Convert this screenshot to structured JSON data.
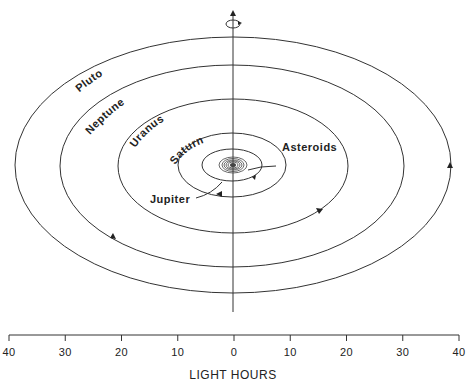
{
  "diagram": {
    "planets": [
      {
        "name": "Pluto",
        "label": "Pluto"
      },
      {
        "name": "Neptune",
        "label": "Neptune"
      },
      {
        "name": "Uranus",
        "label": "Uranus"
      },
      {
        "name": "Saturn",
        "label": "Saturn"
      },
      {
        "name": "Jupiter",
        "label": "Jupiter"
      },
      {
        "name": "Asteroids",
        "label": "Asteroids"
      }
    ],
    "axis": {
      "title": "LIGHT HOURS",
      "ticks": [
        "40",
        "30",
        "20",
        "10",
        "0",
        "10",
        "20",
        "30",
        "40"
      ]
    },
    "rotation_icon": "rotation-arrow-icon"
  }
}
